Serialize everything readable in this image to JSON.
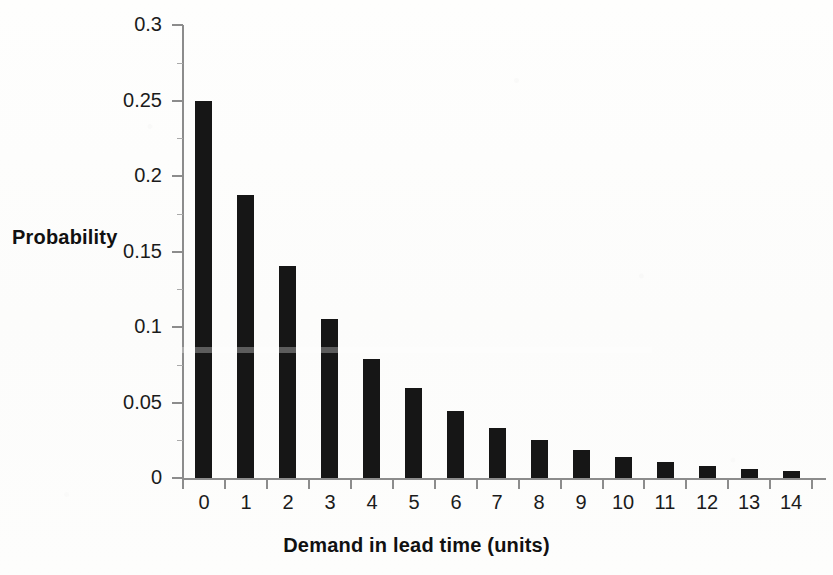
{
  "chart_data": {
    "type": "bar",
    "title": "",
    "xlabel": "Demand in lead time (units)",
    "ylabel": "Probability",
    "categories": [
      "0",
      "1",
      "2",
      "3",
      "4",
      "5",
      "6",
      "7",
      "8",
      "9",
      "10",
      "11",
      "12",
      "13",
      "14"
    ],
    "values": [
      0.25,
      0.1875,
      0.1406,
      0.1055,
      0.0791,
      0.0593,
      0.0445,
      0.0334,
      0.025,
      0.0188,
      0.0141,
      0.0106,
      0.0079,
      0.0059,
      0.0045
    ],
    "ylim": [
      0,
      0.3
    ],
    "xlim_categories": [
      "0",
      "14"
    ],
    "y_ticks": [
      "0",
      "0.05",
      "0.1",
      "0.15",
      "0.2",
      "0.25",
      "0.3"
    ],
    "y_tick_values": [
      0,
      0.05,
      0.1,
      0.15,
      0.2,
      0.25,
      0.3
    ],
    "x_ticks": [
      "0",
      "1",
      "2",
      "3",
      "4",
      "5",
      "6",
      "7",
      "8",
      "9",
      "10",
      "11",
      "12",
      "13",
      "14"
    ],
    "grid": false,
    "legend": null,
    "legend_position": "none",
    "series": [
      {
        "name": "Probability",
        "values": [
          0.25,
          0.1875,
          0.1406,
          0.1055,
          0.0791,
          0.0593,
          0.0445,
          0.0334,
          0.025,
          0.0188,
          0.0141,
          0.0106,
          0.0079,
          0.0059,
          0.0045
        ],
        "color": "#161616"
      }
    ]
  },
  "colors": {
    "bar": "#161616",
    "axis": "#8c8c8c",
    "text": "#1b1b1b",
    "background": "#fdfdfc"
  }
}
